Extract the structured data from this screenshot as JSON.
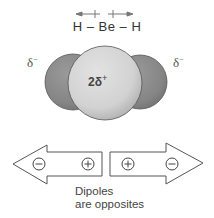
{
  "molecule": {
    "formula": "H – Be – H",
    "left_charge": "δ",
    "left_charge_sign": "−",
    "right_charge": "δ",
    "right_charge_sign": "−",
    "center_charge": "2δ",
    "center_charge_sign": "+"
  },
  "bond_dipoles": {
    "left_direction": "left",
    "right_direction": "right"
  },
  "dipole_arrows": {
    "left": {
      "negative_symbol": "−",
      "positive_symbol": "+"
    },
    "right": {
      "positive_symbol": "+",
      "negative_symbol": "−"
    }
  },
  "caption": {
    "line1": "Dipoles",
    "line2": "are opposites"
  },
  "colors": {
    "outer_atom": "#8a8a8a",
    "center_atom": "#d9d9d9",
    "outline": "#555555"
  }
}
